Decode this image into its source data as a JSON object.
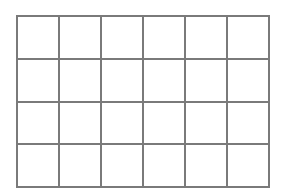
{
  "grid": {
    "rows": 4,
    "columns": 6,
    "line_color": "#7a7a7a",
    "cell_color": "#ffffff",
    "cells": [
      [
        "",
        "",
        "",
        "",
        "",
        ""
      ],
      [
        "",
        "",
        "",
        "",
        "",
        ""
      ],
      [
        "",
        "",
        "",
        "",
        "",
        ""
      ],
      [
        "",
        "",
        "",
        "",
        "",
        ""
      ]
    ]
  }
}
